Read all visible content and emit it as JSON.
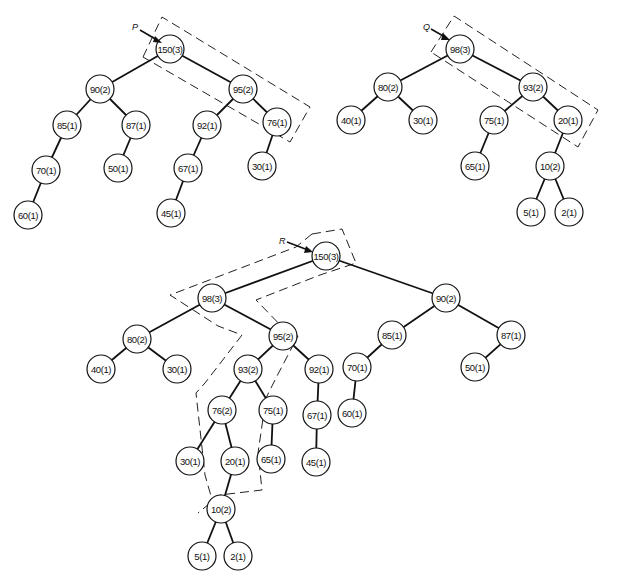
{
  "figure": {
    "trees": [
      {
        "id": "P",
        "pointer_label": "P",
        "nodes": [
          {
            "id": "p150",
            "label": "150(3)",
            "x": 170,
            "y": 49
          },
          {
            "id": "p90",
            "label": "90(2)",
            "x": 100,
            "y": 89
          },
          {
            "id": "p95",
            "label": "95(2)",
            "x": 243,
            "y": 89
          },
          {
            "id": "p85",
            "label": "85(1)",
            "x": 67,
            "y": 125
          },
          {
            "id": "p87",
            "label": "87(1)",
            "x": 136,
            "y": 125
          },
          {
            "id": "p92",
            "label": "92(1)",
            "x": 207,
            "y": 125
          },
          {
            "id": "p76",
            "label": "76(1)",
            "x": 277,
            "y": 122
          },
          {
            "id": "p70",
            "label": "70(1)",
            "x": 46,
            "y": 170
          },
          {
            "id": "p50",
            "label": "50(1)",
            "x": 118,
            "y": 168
          },
          {
            "id": "p67",
            "label": "67(1)",
            "x": 188,
            "y": 168
          },
          {
            "id": "p30",
            "label": "30(1)",
            "x": 262,
            "y": 166
          },
          {
            "id": "p60",
            "label": "60(1)",
            "x": 28,
            "y": 215
          },
          {
            "id": "p45",
            "label": "45(1)",
            "x": 171,
            "y": 213
          }
        ],
        "edges": [
          [
            "p150",
            "p90"
          ],
          [
            "p150",
            "p95"
          ],
          [
            "p90",
            "p85"
          ],
          [
            "p90",
            "p87"
          ],
          [
            "p95",
            "p92"
          ],
          [
            "p95",
            "p76"
          ],
          [
            "p85",
            "p70"
          ],
          [
            "p87",
            "p50"
          ],
          [
            "p92",
            "p67"
          ],
          [
            "p76",
            "p30"
          ],
          [
            "p70",
            "p60"
          ],
          [
            "p67",
            "p45"
          ]
        ]
      },
      {
        "id": "Q",
        "pointer_label": "Q",
        "nodes": [
          {
            "id": "q98",
            "label": "98(3)",
            "x": 460,
            "y": 49
          },
          {
            "id": "q80",
            "label": "80(2)",
            "x": 388,
            "y": 87
          },
          {
            "id": "q93",
            "label": "93(2)",
            "x": 533,
            "y": 87
          },
          {
            "id": "q40",
            "label": "40(1)",
            "x": 351,
            "y": 120
          },
          {
            "id": "q30",
            "label": "30(1)",
            "x": 423,
            "y": 120
          },
          {
            "id": "q75",
            "label": "75(1)",
            "x": 494,
            "y": 120
          },
          {
            "id": "q20",
            "label": "20(1)",
            "x": 568,
            "y": 120
          },
          {
            "id": "q65",
            "label": "65(1)",
            "x": 475,
            "y": 166
          },
          {
            "id": "q10",
            "label": "10(2)",
            "x": 550,
            "y": 166
          },
          {
            "id": "q5",
            "label": "5(1)",
            "x": 531,
            "y": 212
          },
          {
            "id": "q2",
            "label": "2(1)",
            "x": 569,
            "y": 212
          }
        ],
        "edges": [
          [
            "q98",
            "q80"
          ],
          [
            "q98",
            "q93"
          ],
          [
            "q80",
            "q40"
          ],
          [
            "q80",
            "q30"
          ],
          [
            "q93",
            "q75"
          ],
          [
            "q93",
            "q20"
          ],
          [
            "q75",
            "q65"
          ],
          [
            "q20",
            "q10"
          ],
          [
            "q10",
            "q5"
          ],
          [
            "q10",
            "q2"
          ]
        ]
      },
      {
        "id": "R",
        "pointer_label": "R",
        "nodes": [
          {
            "id": "r150",
            "label": "150(3)",
            "x": 326,
            "y": 256
          },
          {
            "id": "r98",
            "label": "98(3)",
            "x": 212,
            "y": 298
          },
          {
            "id": "r90",
            "label": "90(2)",
            "x": 446,
            "y": 298
          },
          {
            "id": "r80",
            "label": "80(2)",
            "x": 137,
            "y": 339
          },
          {
            "id": "r95",
            "label": "95(2)",
            "x": 283,
            "y": 336
          },
          {
            "id": "r85",
            "label": "85(1)",
            "x": 392,
            "y": 335
          },
          {
            "id": "r87",
            "label": "87(1)",
            "x": 511,
            "y": 335
          },
          {
            "id": "r40",
            "label": "40(1)",
            "x": 101,
            "y": 369
          },
          {
            "id": "r30a",
            "label": "30(1)",
            "x": 177,
            "y": 369
          },
          {
            "id": "r93",
            "label": "93(2)",
            "x": 248,
            "y": 369
          },
          {
            "id": "r92",
            "label": "92(1)",
            "x": 319,
            "y": 369
          },
          {
            "id": "r70",
            "label": "70(1)",
            "x": 357,
            "y": 367
          },
          {
            "id": "r50",
            "label": "50(1)",
            "x": 475,
            "y": 367
          },
          {
            "id": "r76",
            "label": "76(2)",
            "x": 222,
            "y": 410
          },
          {
            "id": "r75",
            "label": "75(1)",
            "x": 273,
            "y": 410
          },
          {
            "id": "r67",
            "label": "67(1)",
            "x": 317,
            "y": 415
          },
          {
            "id": "r60",
            "label": "60(1)",
            "x": 352,
            "y": 413
          },
          {
            "id": "r30b",
            "label": "30(1)",
            "x": 190,
            "y": 461
          },
          {
            "id": "r20",
            "label": "20(1)",
            "x": 235,
            "y": 461
          },
          {
            "id": "r65",
            "label": "65(1)",
            "x": 271,
            "y": 459
          },
          {
            "id": "r45",
            "label": "45(1)",
            "x": 316,
            "y": 462
          },
          {
            "id": "r10",
            "label": "10(2)",
            "x": 221,
            "y": 509
          },
          {
            "id": "r5",
            "label": "5(1)",
            "x": 202,
            "y": 556
          },
          {
            "id": "r2",
            "label": "2(1)",
            "x": 238,
            "y": 556
          }
        ],
        "edges": [
          [
            "r150",
            "r98"
          ],
          [
            "r150",
            "r90"
          ],
          [
            "r98",
            "r80"
          ],
          [
            "r98",
            "r95"
          ],
          [
            "r90",
            "r85"
          ],
          [
            "r90",
            "r87"
          ],
          [
            "r80",
            "r40"
          ],
          [
            "r80",
            "r30a"
          ],
          [
            "r95",
            "r93"
          ],
          [
            "r95",
            "r92"
          ],
          [
            "r85",
            "r70"
          ],
          [
            "r87",
            "r50"
          ],
          [
            "r93",
            "r76"
          ],
          [
            "r93",
            "r75"
          ],
          [
            "r92",
            "r67"
          ],
          [
            "r70",
            "r60"
          ],
          [
            "r76",
            "r30b"
          ],
          [
            "r76",
            "r20"
          ],
          [
            "r75",
            "r65"
          ],
          [
            "r67",
            "r45"
          ],
          [
            "r20",
            "r10"
          ],
          [
            "r10",
            "r5"
          ],
          [
            "r10",
            "r2"
          ]
        ]
      }
    ]
  },
  "node_radius": 14
}
